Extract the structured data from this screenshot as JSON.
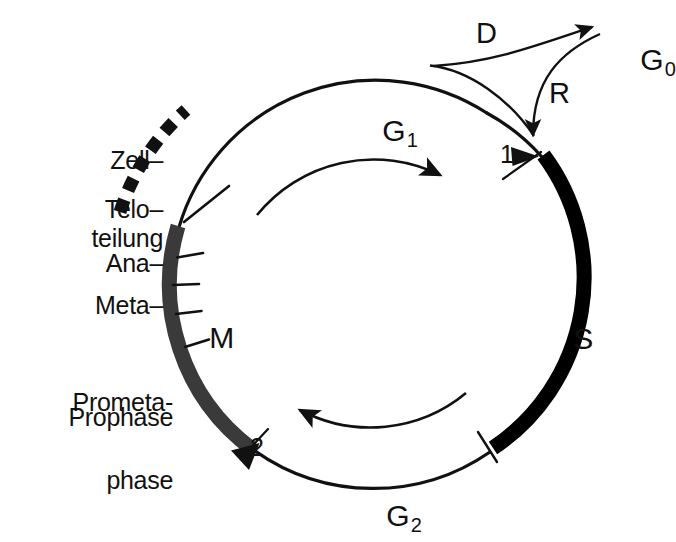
{
  "figure": {
    "type": "cell-cycle-diagram",
    "language": "de",
    "background_color": "#ffffff",
    "ink_color": "#111111",
    "s_phase_arc_color": "#000000",
    "m_phase_arc_color": "#3a3a3a"
  },
  "cycle": {
    "center_label_top": "G1",
    "phases": [
      {
        "key": "G1",
        "label": "G",
        "subscript": "1",
        "arc_style": "thin-line",
        "position": "top"
      },
      {
        "key": "S",
        "label": "S",
        "subscript": "",
        "arc_style": "thick-black",
        "position": "right"
      },
      {
        "key": "G2",
        "label": "G",
        "subscript": "2",
        "arc_style": "thin-line",
        "position": "bottom"
      },
      {
        "key": "M",
        "label": "M",
        "subscript": "",
        "arc_style": "thick-gray",
        "position": "left"
      }
    ],
    "direction": "clockwise",
    "rotation_arrows": [
      {
        "name": "top-rotation-arrow",
        "points": "clockwise-right"
      },
      {
        "name": "bottom-rotation-arrow",
        "points": "clockwise-left"
      }
    ]
  },
  "checkpoints": [
    {
      "id": "1",
      "label": "1",
      "location": "G1/S boundary"
    },
    {
      "id": "2",
      "label": "2",
      "location": "M/G2 boundary"
    }
  ],
  "resting_state": {
    "label": "G",
    "subscript": "0",
    "exit_path_label": "D",
    "reentry_path_label": "R"
  },
  "mitosis_subphases": {
    "bracket_label_line1": "Zell–",
    "bracket_label_line2": "teilung",
    "items": [
      {
        "label": "Telo–"
      },
      {
        "label": "Ana–"
      },
      {
        "label": "Meta–"
      },
      {
        "label_line1": "Prometa-",
        "label_line2": "phase"
      },
      {
        "label": "Prophase"
      }
    ]
  }
}
